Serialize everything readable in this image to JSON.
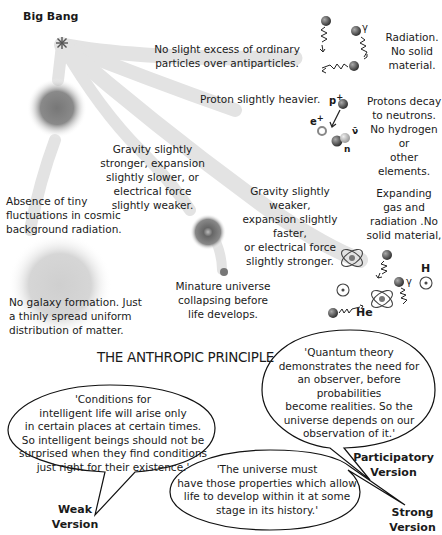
{
  "origin": {
    "label": "Big Bang",
    "icon": "starburst-icon"
  },
  "branches": [
    {
      "id": "antiparticles",
      "condition": "No slight excess of ordinary particles over antiparticles.",
      "outcome": "Radiation. No solid material.",
      "symbols": [
        "γ"
      ]
    },
    {
      "id": "proton",
      "condition": "Proton slightly heavier.",
      "outcome": "Protons decay to neutrons. No hydrogen or other elements.",
      "symbols": [
        "p+",
        "e+",
        "ν̄",
        "n"
      ]
    },
    {
      "id": "gravity-stronger",
      "condition": "Gravity slightly stronger, expansion slightly slower, or electrical force slightly weaker.",
      "outcome": "Minature universe collapsing before life develops."
    },
    {
      "id": "fluctuations",
      "condition": "Absence of tiny fluctuations in cosmic background radiation.",
      "outcome": "No galaxy formation. Just a thinly spread uniform distribution of matter."
    },
    {
      "id": "gravity-weaker",
      "condition": "Gravity slightly weaker, expansion slightly faster, or electrical force slightly stronger.",
      "outcome": "Expanding gas and radiation .No solid material,",
      "symbols": [
        "H",
        "He",
        "γ"
      ]
    }
  ],
  "section_title": "THE ANTHROPIC PRINCIPLE",
  "versions": [
    {
      "name": "Weak Version",
      "name_line1": "Weak",
      "name_line2": "Version",
      "quote_lines": [
        "'Conditions for",
        "intelligent life will arise only",
        "in certain places at certain times.",
        "So intelligent beings should not be",
        "surprised when they find conditions",
        "just right for their existence.'"
      ]
    },
    {
      "name": "Participatory Version",
      "name_line1": "Participatory",
      "name_line2": "Version",
      "quote_lines": [
        "'Quantum theory",
        "demonstrates the need for",
        "an observer, before probabilities",
        "become realities. So the",
        "universe depends on our",
        "observation of it.'"
      ]
    },
    {
      "name": "Strong Version",
      "name_line1": "Strong",
      "name_line2": "Version",
      "quote_lines": [
        "'The universe must",
        "have those properties which allow",
        "life to develop within it at some",
        "stage in its history.'"
      ]
    }
  ],
  "labels": {
    "a1": "No slight excess of ordinary",
    "a2": "particles over antiparticles.",
    "r1": "Radiation.",
    "r2": "No solid",
    "r3": "material.",
    "p0": "Proton slightly heavier.",
    "pd1": "Protons decay",
    "pd2": "to neutrons.",
    "pd3": "No hydrogen or",
    "pd4": "other elements.",
    "gs1": "Gravity slightly",
    "gs2": "stronger, expansion",
    "gs3": "slightly slower, or",
    "gs4": "electrical force",
    "gs5": "slightly weaker.",
    "f1": "Absence of tiny",
    "f2": "fluctuations in cosmic",
    "f3": "background radiation.",
    "gw1": "Gravity slightly weaker,",
    "gw2": "expansion slightly faster,",
    "gw3": "or electrical force",
    "gw4": "slightly stronger.",
    "e1": "Expanding",
    "e2": "gas and",
    "e3": "radiation .No",
    "e4": "solid material,",
    "m1": "Minature universe",
    "m2": "collapsing before",
    "m3": "life develops.",
    "g1": "No galaxy formation. Just",
    "g2": "a thinly spread uniform",
    "g3": "distribution of matter.",
    "gamma": "γ",
    "p": "p",
    "plus": "+",
    "e": "e",
    "nubar": "ν̄",
    "n": "n",
    "H": "H",
    "He": "He"
  }
}
